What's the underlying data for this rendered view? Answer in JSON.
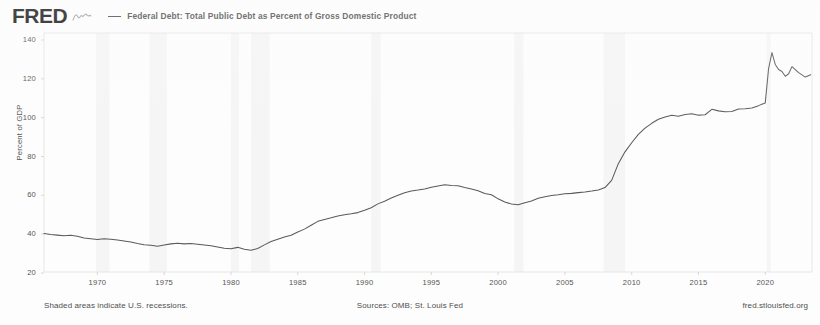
{
  "header": {
    "logo_text": "FRED",
    "logo_mark": "squiggle-mark",
    "legend_label": "Federal Debt: Total Public Debt as Percent of Gross Domestic Product",
    "legend_color": "#4a4a4a"
  },
  "axes": {
    "ylabel": "Percent of GDP",
    "yticks": [
      "140",
      "120",
      "100",
      "80",
      "60",
      "40",
      "20"
    ],
    "xticks": [
      "1970",
      "1975",
      "1980",
      "1985",
      "1990",
      "1995",
      "2000",
      "2005",
      "2010",
      "2015",
      "2020"
    ]
  },
  "footer": {
    "left": "Shaded areas indicate U.S. recessions.",
    "center": "Sources: OMB; St. Louis Fed",
    "right": "fred.stlouisfed.org"
  },
  "chart_data": {
    "type": "line",
    "title": "Federal Debt: Total Public Debt as Percent of Gross Domestic Product",
    "xlabel": "",
    "ylabel": "Percent of GDP",
    "xlim": [
      1966,
      2023.5
    ],
    "ylim": [
      20,
      145
    ],
    "ytick_values": [
      140,
      120,
      100,
      80,
      60,
      40,
      20
    ],
    "xtick_values": [
      1970,
      1975,
      1980,
      1985,
      1990,
      1995,
      2000,
      2005,
      2010,
      2015,
      2020
    ],
    "grid": false,
    "legend_position": "top",
    "line_color": "#5a5a5a",
    "recession_band_color": "#eeeeee",
    "recession_bands": [
      [
        1969.9,
        1970.9
      ],
      [
        1973.9,
        1975.2
      ],
      [
        1980.0,
        1980.6
      ],
      [
        1981.5,
        1982.9
      ],
      [
        1990.5,
        1991.2
      ],
      [
        2001.2,
        2001.9
      ],
      [
        2007.9,
        2009.5
      ],
      [
        2020.1,
        2020.4
      ]
    ],
    "series": [
      {
        "name": "Federal Debt: Total Public Debt as Percent of Gross Domestic Product",
        "x": [
          1966.0,
          1966.5,
          1967.0,
          1967.5,
          1968.0,
          1968.5,
          1969.0,
          1969.5,
          1970.0,
          1970.5,
          1971.0,
          1971.5,
          1972.0,
          1972.5,
          1973.0,
          1973.5,
          1974.0,
          1974.5,
          1975.0,
          1975.5,
          1976.0,
          1976.5,
          1977.0,
          1977.5,
          1978.0,
          1978.5,
          1979.0,
          1979.5,
          1980.0,
          1980.5,
          1981.0,
          1981.5,
          1982.0,
          1982.5,
          1983.0,
          1983.5,
          1984.0,
          1984.5,
          1985.0,
          1985.5,
          1986.0,
          1986.5,
          1987.0,
          1987.5,
          1988.0,
          1988.5,
          1989.0,
          1989.5,
          1990.0,
          1990.5,
          1991.0,
          1991.5,
          1992.0,
          1992.5,
          1993.0,
          1993.5,
          1994.0,
          1994.5,
          1995.0,
          1995.5,
          1996.0,
          1996.5,
          1997.0,
          1997.5,
          1998.0,
          1998.5,
          1999.0,
          1999.5,
          2000.0,
          2000.5,
          2001.0,
          2001.5,
          2002.0,
          2002.5,
          2003.0,
          2003.5,
          2004.0,
          2004.5,
          2005.0,
          2005.5,
          2006.0,
          2006.5,
          2007.0,
          2007.5,
          2008.0,
          2008.5,
          2009.0,
          2009.5,
          2010.0,
          2010.5,
          2011.0,
          2011.5,
          2012.0,
          2012.5,
          2013.0,
          2013.5,
          2014.0,
          2014.5,
          2015.0,
          2015.5,
          2016.0,
          2016.5,
          2017.0,
          2017.5,
          2018.0,
          2018.5,
          2019.0,
          2019.5,
          2020.0,
          2020.25,
          2020.5,
          2020.75,
          2021.0,
          2021.25,
          2021.5,
          2021.75,
          2022.0,
          2022.5,
          2023.0,
          2023.4
        ],
        "y": [
          40.3,
          39.8,
          39.5,
          39.2,
          39.4,
          38.9,
          38.0,
          37.6,
          37.2,
          37.6,
          37.4,
          37.0,
          36.5,
          36.0,
          35.2,
          34.6,
          34.3,
          33.8,
          34.4,
          35.0,
          35.3,
          35.0,
          35.2,
          34.8,
          34.4,
          34.0,
          33.4,
          32.8,
          32.5,
          33.2,
          32.2,
          31.7,
          32.6,
          34.5,
          36.2,
          37.4,
          38.5,
          39.4,
          41.1,
          42.6,
          44.6,
          46.6,
          47.6,
          48.4,
          49.3,
          50.0,
          50.5,
          51.1,
          52.3,
          53.6,
          55.6,
          57.0,
          58.6,
          60.0,
          61.3,
          62.2,
          62.7,
          63.3,
          64.2,
          64.8,
          65.4,
          65.1,
          64.9,
          64.0,
          63.3,
          62.4,
          61.0,
          60.3,
          58.2,
          56.6,
          55.5,
          55.1,
          56.2,
          57.1,
          58.5,
          59.3,
          59.9,
          60.3,
          60.8,
          61.0,
          61.4,
          61.7,
          62.2,
          62.8,
          64.0,
          67.7,
          76.3,
          82.4,
          87.1,
          91.4,
          94.6,
          97.1,
          99.2,
          100.4,
          101.2,
          100.7,
          101.6,
          102.0,
          101.3,
          101.5,
          104.3,
          103.5,
          103.0,
          103.2,
          104.5,
          104.6,
          105.0,
          106.2,
          107.6,
          125.3,
          133.5,
          127.4,
          124.8,
          123.8,
          121.3,
          122.6,
          126.3,
          123.2,
          120.9,
          122.1
        ]
      }
    ]
  }
}
